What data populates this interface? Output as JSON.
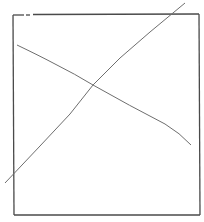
{
  "diagram": {
    "type": "line-drawing",
    "colors": {
      "background": "#ffffff",
      "frame": "#4a4a4a",
      "lines": "#6e6e6e"
    },
    "frame": {
      "left": 13,
      "top": 14,
      "right": 199,
      "bottom": 215,
      "top_gap": [
        24,
        33
      ]
    },
    "lines": [
      {
        "name": "ascending-line",
        "x1": 5,
        "y1": 183,
        "x2": 185,
        "y2": 3
      },
      {
        "name": "descending-line",
        "x1": 17,
        "y1": 45,
        "x2": 191,
        "y2": 145
      }
    ],
    "intersection": {
      "x": 93,
      "y": 85
    }
  }
}
